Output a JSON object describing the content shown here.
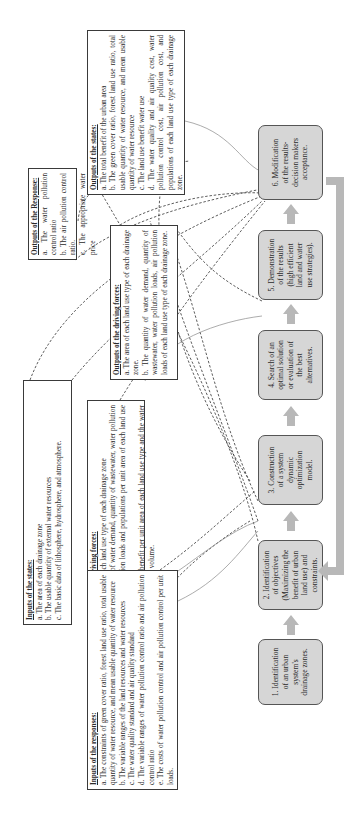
{
  "orientation": "rotated-90-counterclockwise",
  "boxes": {
    "outputs_states": {
      "title": "Outputs of the states:",
      "items": [
        "a.  The total benefit of the urban area",
        "b. The green cover ratio, forest land use ratio, total usable quantity of water resource, and mean usable quantity of water resource",
        "c. The land use benefit water use",
        "d. The water quality and air quality cost, water pollution control cost, air pollution cost, and populations of each land use type of each drainage zone."
      ]
    },
    "outputs_response": {
      "title": "Outputs of the Response:",
      "items": [
        "a. The water pollution control ratio",
        "b. The air pollution control ratio.",
        "c. The appropriate water price"
      ]
    },
    "outputs_driving": {
      "title": "Outputs of the driving forces:",
      "items": [
        "a. The area of each land use type of each drainage zone.",
        "b. The quantity of water demand, quantity of wastewater, water pollution loads, air pollution loads of each land use type of each drainage zone."
      ]
    },
    "inputs_states": {
      "title": "Inputs of the states:",
      "items": [
        "a. The area of each drainage zone",
        "b. The usable quantity of external water resources",
        "c. The basic data of lithosphere, hydrosphere, and atmosphere."
      ]
    },
    "inputs_driving": {
      "title": "Inputs of the driving forces:",
      "items": [
        "a. The area of each land use type of each drainage zone",
        "b. The quantity of water demand, quantity of wastewater, water pollution loads, air pollution loads and populations per unit area of each land use type",
        "c. The land use benefit per unit area of each land use type and the water use cost per unit volume."
      ]
    },
    "inputs_responses": {
      "title": "Inputs of the responses:",
      "items": [
        "a. The constraints of green cover ratio, forest land use ratio, total usable quantity of water resource, and mean usable quantity of water resource",
        "b. The variable ranges of the land resources and water resources",
        "c. The water quality standard and air quality standard",
        "d. The variable ranges of water pollution control ratio and air pollution control ratio",
        "e. The costs of water pollution control and air pollution control per unit loads."
      ]
    }
  },
  "process_steps": [
    {
      "lines": [
        "1. Identification",
        "of an urban",
        "system's",
        "drainage zones."
      ]
    },
    {
      "lines": [
        "2. Identification",
        "of objectives",
        "(Maximizing the",
        "benefit of urban",
        "land use) and",
        "constraints."
      ]
    },
    {
      "lines": [
        "3. Construction",
        "of a system",
        "dynamic",
        "optimization",
        "model."
      ]
    },
    {
      "lines": [
        "4. Search of an",
        "optimal solution",
        "or evaluation of",
        "the best",
        "alternatives."
      ]
    },
    {
      "lines": [
        "5. Demonstration",
        "of the results",
        "(high efficient",
        "land and water",
        "use strategies)."
      ]
    },
    {
      "lines": [
        "6. Modification",
        "of the results-",
        "decision makers",
        "acceptance."
      ]
    }
  ],
  "colors": {
    "process_fill": "#d6d6d6",
    "arrow_fill": "#b8b8b8",
    "feedback_bar": "#b8b8b8",
    "border": "#3a3a3a",
    "link_line": "#333333"
  }
}
